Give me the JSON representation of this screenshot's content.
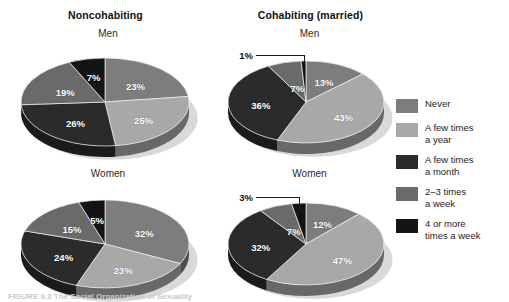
{
  "chart_data": {
    "type": "pie",
    "legend_position": "right",
    "categories": [
      "Never",
      "A few times a year",
      "A few times a month",
      "2–3 times a week",
      "4 or more times a week"
    ],
    "category_colors": [
      "#7d7d7d",
      "#a8a8a8",
      "#2b2b2b",
      "#6a6a6a",
      "#141414"
    ],
    "charts": [
      {
        "group": "Noncohabiting",
        "sublabel": "Men",
        "values": [
          23,
          25,
          26,
          19,
          7
        ],
        "labels": [
          "23%",
          "25%",
          "26%",
          "19%",
          "7%"
        ]
      },
      {
        "group": "Cohabiting (married)",
        "sublabel": "Men",
        "values": [
          13,
          43,
          36,
          7,
          1
        ],
        "labels": [
          "13%",
          "43%",
          "36%",
          "7%",
          "1%"
        ]
      },
      {
        "group": "Noncohabiting",
        "sublabel": "Women",
        "values": [
          32,
          23,
          24,
          15,
          5
        ],
        "labels": [
          "32%",
          "23%",
          "24%",
          "15%",
          "5%"
        ]
      },
      {
        "group": "Cohabiting (married)",
        "sublabel": "Women",
        "values": [
          12,
          47,
          32,
          7,
          3
        ],
        "labels": [
          "12%",
          "47%",
          "32%",
          "7%",
          "3%"
        ]
      }
    ]
  },
  "groups": [
    {
      "title": "Noncohabiting"
    },
    {
      "title": "Cohabiting (married)"
    }
  ],
  "pies": [
    {
      "id": "noncohabiting-men",
      "sublabel": "Men",
      "slices": [
        {
          "label": "23%",
          "value": 23,
          "category": "Never"
        },
        {
          "label": "25%",
          "value": 25,
          "category": "A few times a year"
        },
        {
          "label": "26%",
          "value": 26,
          "category": "A few times a month"
        },
        {
          "label": "19%",
          "value": 19,
          "category": "2–3 times a week"
        },
        {
          "label": "7%",
          "value": 7,
          "category": "4 or more times a week"
        }
      ]
    },
    {
      "id": "cohabiting-men",
      "sublabel": "Men",
      "callout": "1%",
      "slices": [
        {
          "label": "13%",
          "value": 13,
          "category": "Never"
        },
        {
          "label": "43%",
          "value": 43,
          "category": "A few times a year"
        },
        {
          "label": "36%",
          "value": 36,
          "category": "A few times a month"
        },
        {
          "label": "7%",
          "value": 7,
          "category": "2–3 times a week"
        },
        {
          "label": "1%",
          "value": 1,
          "category": "4 or more times a week"
        }
      ]
    },
    {
      "id": "noncohabiting-women",
      "sublabel": "Women",
      "slices": [
        {
          "label": "32%",
          "value": 32,
          "category": "Never"
        },
        {
          "label": "23%",
          "value": 23,
          "category": "A few times a year"
        },
        {
          "label": "24%",
          "value": 24,
          "category": "A few times a month"
        },
        {
          "label": "15%",
          "value": 15,
          "category": "2–3 times a week"
        },
        {
          "label": "5%",
          "value": 5,
          "category": "4 or more times a week"
        }
      ]
    },
    {
      "id": "cohabiting-women",
      "sublabel": "Women",
      "callout": "3%",
      "slices": [
        {
          "label": "12%",
          "value": 12,
          "category": "Never"
        },
        {
          "label": "47%",
          "value": 47,
          "category": "A few times a year"
        },
        {
          "label": "32%",
          "value": 32,
          "category": "A few times a month"
        },
        {
          "label": "7%",
          "value": 7,
          "category": "2–3 times a week"
        },
        {
          "label": "3%",
          "value": 3,
          "category": "4 or more times a week"
        }
      ]
    }
  ],
  "legend": {
    "items": [
      {
        "label": "Never",
        "color": "#7d7d7d"
      },
      {
        "label": "A few times\na year",
        "color": "#a8a8a8"
      },
      {
        "label": "A few times\na month",
        "color": "#2b2b2b"
      },
      {
        "label": "2–3 times\na week",
        "color": "#6a6a6a"
      },
      {
        "label": "4 or more\ntimes a week",
        "color": "#141414"
      }
    ]
  },
  "caption": {
    "text": "FIGURE 9.3   The Social Organization of Sexuality"
  }
}
